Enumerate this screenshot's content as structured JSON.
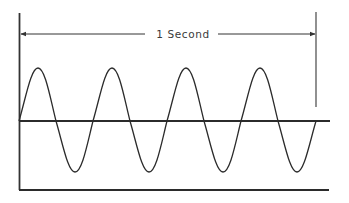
{
  "diagram": {
    "duration_label": "1 Second",
    "cycles": 4,
    "colors": {
      "stroke": "#2b2b2b",
      "axis": "#333333",
      "text": "#3a3a3a",
      "background": "#ffffff"
    }
  }
}
